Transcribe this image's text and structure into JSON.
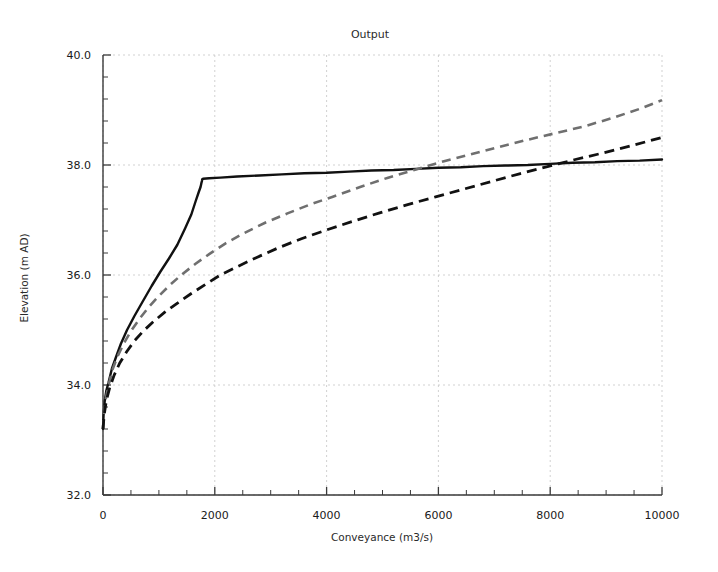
{
  "chart_data": {
    "type": "line",
    "title": "Output",
    "xlabel": "Conveyance (m3/s)",
    "ylabel": "Elevation (m AD)",
    "xlim": [
      0,
      10000
    ],
    "ylim": [
      32.0,
      40.0
    ],
    "grid": true,
    "legend": "none",
    "x_ticks": [
      0,
      2000,
      4000,
      6000,
      8000,
      10000
    ],
    "x_tick_labels": [
      "0",
      "2000",
      "4000",
      "6000",
      "8000",
      "10000"
    ],
    "x_minor_interval": 500,
    "y_ticks": [
      32.0,
      34.0,
      36.0,
      38.0,
      40.0
    ],
    "y_tick_labels": [
      "32.0",
      "34.0",
      "36.0",
      "38.0",
      "40.0"
    ],
    "y_minor_interval": 0.4,
    "series": [
      {
        "name": "Total conveyance",
        "style": "solid",
        "color": "#111111",
        "x": [
          0,
          10,
          30,
          60,
          100,
          160,
          230,
          320,
          430,
          560,
          700,
          870,
          1020,
          1180,
          1330,
          1470,
          1580,
          1660,
          1710,
          1745,
          1760,
          1770,
          1775,
          1790,
          1900,
          2100,
          2400,
          2800,
          3200,
          3600,
          4000,
          4400,
          4800,
          5200,
          5600,
          6000,
          6400,
          6800,
          7200,
          7600,
          8000,
          8400,
          8800,
          9200,
          9600,
          10000
        ],
        "y": [
          33.2,
          33.45,
          33.7,
          33.9,
          34.05,
          34.3,
          34.5,
          34.75,
          35.0,
          35.25,
          35.5,
          35.8,
          36.05,
          36.3,
          36.55,
          36.85,
          37.1,
          37.35,
          37.5,
          37.6,
          37.67,
          37.71,
          37.74,
          37.75,
          37.76,
          37.77,
          37.79,
          37.81,
          37.83,
          37.85,
          37.86,
          37.88,
          37.9,
          37.91,
          37.93,
          37.95,
          37.96,
          37.98,
          37.99,
          38.0,
          38.02,
          38.04,
          38.05,
          38.07,
          38.08,
          38.1
        ]
      },
      {
        "name": "Channel conveyance",
        "style": "dashed",
        "color": "#6f6f6f",
        "x": [
          0,
          20,
          50,
          100,
          170,
          260,
          370,
          500,
          650,
          820,
          1000,
          1200,
          1400,
          1650,
          1900,
          2200,
          2500,
          2900,
          3300,
          3700,
          4100,
          4600,
          5100,
          5600,
          6100,
          6600,
          7100,
          7600,
          8100,
          8600,
          9100,
          9600,
          10000
        ],
        "y": [
          33.2,
          33.5,
          33.75,
          34.0,
          34.28,
          34.52,
          34.75,
          34.98,
          35.2,
          35.42,
          35.62,
          35.82,
          36.0,
          36.2,
          36.38,
          36.58,
          36.75,
          36.95,
          37.12,
          37.28,
          37.42,
          37.6,
          37.77,
          37.92,
          38.07,
          38.2,
          38.33,
          38.46,
          38.58,
          38.7,
          38.85,
          39.02,
          39.18
        ]
      },
      {
        "name": "Floodplain conveyance",
        "style": "dashed",
        "color": "#111111",
        "x": [
          0,
          20,
          60,
          120,
          200,
          300,
          420,
          560,
          720,
          900,
          1100,
          1320,
          1560,
          1820,
          2100,
          2400,
          2750,
          3150,
          3550,
          4000,
          4450,
          4950,
          5450,
          5950,
          6450,
          6950,
          7450,
          7950,
          8450,
          8950,
          9450,
          10000
        ],
        "y": [
          33.2,
          33.45,
          33.72,
          33.95,
          34.18,
          34.4,
          34.6,
          34.8,
          34.98,
          35.15,
          35.32,
          35.48,
          35.65,
          35.82,
          36.0,
          36.15,
          36.32,
          36.5,
          36.66,
          36.82,
          36.97,
          37.13,
          37.28,
          37.42,
          37.56,
          37.7,
          37.84,
          37.97,
          38.1,
          38.22,
          38.35,
          38.5
        ]
      }
    ]
  },
  "title": "Output",
  "axes": {
    "x_title": "Conveyance (m3/s)",
    "y_title": "Elevation (m AD)"
  },
  "x_labels": {
    "t0": "0",
    "t1": "2000",
    "t2": "4000",
    "t3": "6000",
    "t4": "8000",
    "t5": "10000"
  },
  "y_labels": {
    "t0": "32.0",
    "t1": "34.0",
    "t2": "36.0",
    "t3": "38.0",
    "t4": "40.0"
  },
  "colors": {
    "series_solid": "#111111",
    "series_gray_dashed": "#6f6f6f",
    "series_black_dashed": "#111111",
    "grid": "#cccccc",
    "axis": "#3a3a3a",
    "background": "#ffffff"
  }
}
